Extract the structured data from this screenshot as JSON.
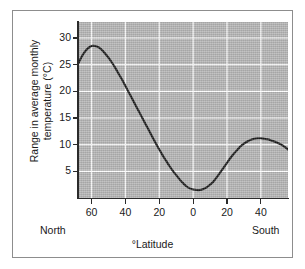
{
  "chart_data": {
    "type": "line",
    "title": "",
    "subtitle": "",
    "xlabel": "°Latitude",
    "ylabel": "Range in average monthly temperature (°C)",
    "ylabel_line1": "Range in average monthly",
    "ylabel_line2": "temperature (°C)",
    "left_hemisphere_label": "North",
    "right_hemisphere_label": "South",
    "grid": true,
    "legend": "none",
    "plot_background_color": "#b3b3b3",
    "gridline_color": "#ffffff",
    "line_color": "#1a1a1a",
    "axis_color": "#2b2b2b",
    "xlim": [
      68,
      -56
    ],
    "ylim": [
      0,
      33
    ],
    "x_axis_note": "x axis runs from 68° North on the left through 0° to 56° South on the right; tick labels show absolute degrees",
    "xticks": [
      {
        "label": "60",
        "value": 60
      },
      {
        "label": "40",
        "value": 40
      },
      {
        "label": "20",
        "value": 20
      },
      {
        "label": "0",
        "value": 0
      },
      {
        "label": "20",
        "value": -20
      },
      {
        "label": "40",
        "value": -40
      }
    ],
    "yticks": [
      {
        "label": "30",
        "value": 30
      },
      {
        "label": "25",
        "value": 25
      },
      {
        "label": "20",
        "value": 20
      },
      {
        "label": "15",
        "value": 15
      },
      {
        "label": "10",
        "value": 10
      },
      {
        "label": "5",
        "value": 5
      }
    ],
    "series": [
      {
        "name": "Range in average monthly temperature",
        "x": [
          68,
          66,
          64,
          62,
          60,
          58,
          56,
          54,
          52,
          50,
          48,
          46,
          44,
          42,
          40,
          38,
          36,
          34,
          32,
          30,
          28,
          26,
          24,
          22,
          20,
          18,
          16,
          14,
          12,
          10,
          8,
          6,
          4,
          2,
          0,
          -2,
          -4,
          -6,
          -8,
          -10,
          -12,
          -14,
          -16,
          -18,
          -20,
          -22,
          -24,
          -26,
          -28,
          -30,
          -32,
          -34,
          -36,
          -38,
          -40,
          -42,
          -44,
          -46,
          -48,
          -50,
          -52,
          -54,
          -56
        ],
        "y": [
          25.1,
          26.4,
          27.4,
          28.1,
          28.5,
          28.5,
          28.3,
          27.8,
          27.1,
          26.3,
          25.4,
          24.4,
          23.3,
          22.2,
          21.0,
          19.8,
          18.6,
          17.4,
          16.2,
          15.0,
          13.8,
          12.6,
          11.4,
          10.2,
          9.1,
          8.0,
          7.0,
          6.0,
          5.1,
          4.3,
          3.5,
          2.8,
          2.2,
          1.8,
          1.6,
          1.5,
          1.5,
          1.7,
          2.0,
          2.5,
          3.1,
          3.9,
          4.8,
          5.7,
          6.6,
          7.5,
          8.3,
          9.0,
          9.7,
          10.2,
          10.6,
          10.9,
          11.1,
          11.2,
          11.2,
          11.1,
          11.0,
          10.8,
          10.6,
          10.3,
          10.0,
          9.6,
          9.1
        ]
      }
    ],
    "annotations": [
      {
        "text": "peak ≈ 28.5 °C near 60° North"
      },
      {
        "text": "minimum ≈ 1.5 °C near the equator (a few degrees South)"
      },
      {
        "text": "secondary peak ≈ 11.2 °C near 38° South"
      }
    ]
  }
}
